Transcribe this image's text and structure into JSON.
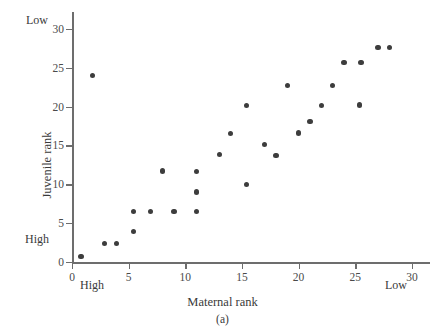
{
  "figure": {
    "panel_caption": "(a)",
    "x_axis_title": "Maternal rank",
    "y_axis_title": "Juvenile rank",
    "marker_color": "#3d3d3d",
    "axis_color": "#6d6d6d",
    "background_color": "#ffffff"
  },
  "annotations": {
    "y_low": "Low",
    "y_high": "High",
    "x_high": "High",
    "x_low": "Low"
  },
  "axes": {
    "x_ticks": [
      "0",
      "5",
      "10",
      "15",
      "20",
      "25",
      "30"
    ],
    "y_ticks": [
      "0",
      "5",
      "10",
      "15",
      "20",
      "25",
      "30"
    ]
  },
  "chart_data": {
    "type": "scatter",
    "title": "(a)",
    "xlabel": "Maternal rank",
    "ylabel": "Juvenile rank",
    "xlim": [
      0,
      30.8
    ],
    "ylim": [
      0,
      31
    ],
    "xticks": [
      0,
      5,
      10,
      15,
      20,
      25,
      30
    ],
    "yticks": [
      0,
      5,
      10,
      15,
      20,
      25,
      30
    ],
    "grid": false,
    "legend": false,
    "x_axis_direction_note": "High at left (low rank numbers), Low at right",
    "y_axis_direction_note": "High at bottom (low rank numbers), Low at top",
    "points": [
      {
        "x": 0.8,
        "y": 0.7
      },
      {
        "x": 1.8,
        "y": 24.0
      },
      {
        "x": 2.9,
        "y": 2.4
      },
      {
        "x": 3.9,
        "y": 2.4
      },
      {
        "x": 5.4,
        "y": 3.9
      },
      {
        "x": 5.4,
        "y": 6.5
      },
      {
        "x": 6.9,
        "y": 6.5
      },
      {
        "x": 8.0,
        "y": 11.7
      },
      {
        "x": 9.0,
        "y": 6.5
      },
      {
        "x": 11.0,
        "y": 6.5
      },
      {
        "x": 11.0,
        "y": 9.0
      },
      {
        "x": 11.0,
        "y": 11.6
      },
      {
        "x": 13.0,
        "y": 13.8
      },
      {
        "x": 14.0,
        "y": 16.5
      },
      {
        "x": 15.4,
        "y": 10.0
      },
      {
        "x": 15.4,
        "y": 20.1
      },
      {
        "x": 17.0,
        "y": 15.1
      },
      {
        "x": 18.0,
        "y": 13.7
      },
      {
        "x": 19.0,
        "y": 22.7
      },
      {
        "x": 20.0,
        "y": 16.6
      },
      {
        "x": 21.0,
        "y": 18.1
      },
      {
        "x": 22.0,
        "y": 20.1
      },
      {
        "x": 23.0,
        "y": 22.7
      },
      {
        "x": 24.0,
        "y": 25.7
      },
      {
        "x": 25.4,
        "y": 20.2
      },
      {
        "x": 25.5,
        "y": 25.7
      },
      {
        "x": 27.0,
        "y": 27.6
      },
      {
        "x": 28.0,
        "y": 27.6
      }
    ]
  }
}
